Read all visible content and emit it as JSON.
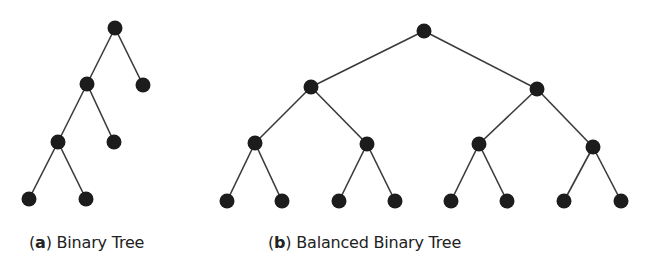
{
  "figures": [
    {
      "id": "a",
      "label_letter": "a",
      "caption": "Binary Tree",
      "nodes": [
        {
          "id": "a0",
          "x": 115,
          "y": 28
        },
        {
          "id": "a1",
          "x": 87,
          "y": 84
        },
        {
          "id": "a2",
          "x": 143,
          "y": 85
        },
        {
          "id": "a3",
          "x": 58,
          "y": 142
        },
        {
          "id": "a4",
          "x": 114,
          "y": 142
        },
        {
          "id": "a5",
          "x": 29,
          "y": 199
        },
        {
          "id": "a6",
          "x": 86,
          "y": 199
        }
      ],
      "edges": [
        [
          "a0",
          "a1"
        ],
        [
          "a0",
          "a2"
        ],
        [
          "a1",
          "a3"
        ],
        [
          "a1",
          "a4"
        ],
        [
          "a3",
          "a5"
        ],
        [
          "a3",
          "a6"
        ]
      ]
    },
    {
      "id": "b",
      "label_letter": "b",
      "caption": "Balanced Binary Tree",
      "nodes": [
        {
          "id": "b0",
          "x": 424,
          "y": 31
        },
        {
          "id": "b1",
          "x": 311,
          "y": 87
        },
        {
          "id": "b2",
          "x": 537,
          "y": 89
        },
        {
          "id": "b3",
          "x": 255,
          "y": 143
        },
        {
          "id": "b4",
          "x": 367,
          "y": 144
        },
        {
          "id": "b5",
          "x": 479,
          "y": 144
        },
        {
          "id": "b6",
          "x": 593,
          "y": 147
        },
        {
          "id": "b7",
          "x": 227,
          "y": 201
        },
        {
          "id": "b8",
          "x": 282,
          "y": 201
        },
        {
          "id": "b9",
          "x": 339,
          "y": 201
        },
        {
          "id": "b10",
          "x": 395,
          "y": 201
        },
        {
          "id": "b11",
          "x": 451,
          "y": 201
        },
        {
          "id": "b12",
          "x": 507,
          "y": 201
        },
        {
          "id": "b13",
          "x": 564,
          "y": 201
        },
        {
          "id": "b14",
          "x": 621,
          "y": 201
        }
      ],
      "edges": [
        [
          "b0",
          "b1"
        ],
        [
          "b0",
          "b2"
        ],
        [
          "b1",
          "b3"
        ],
        [
          "b1",
          "b4"
        ],
        [
          "b2",
          "b5"
        ],
        [
          "b2",
          "b6"
        ],
        [
          "b3",
          "b7"
        ],
        [
          "b3",
          "b8"
        ],
        [
          "b4",
          "b9"
        ],
        [
          "b4",
          "b10"
        ],
        [
          "b5",
          "b11"
        ],
        [
          "b5",
          "b12"
        ],
        [
          "b6",
          "b13"
        ],
        [
          "b6",
          "b14"
        ]
      ]
    }
  ],
  "style": {
    "node_color": "#1c1c1c",
    "edge_color": "#3a3a3a",
    "node_radius": 7.5
  }
}
